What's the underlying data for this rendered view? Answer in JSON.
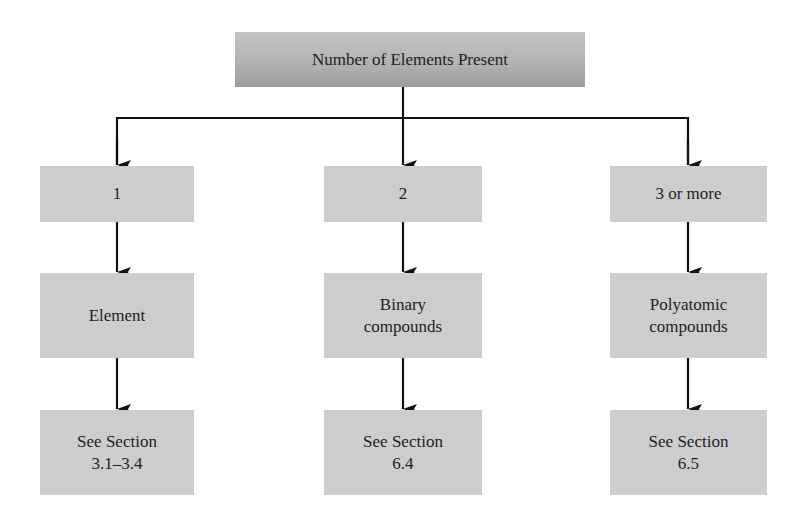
{
  "diagram": {
    "root": {
      "label": "Number of Elements Present"
    },
    "branches": [
      {
        "count_label": "1",
        "category_label": "Element",
        "reference_label": "See Section\n3.1–3.4"
      },
      {
        "count_label": "2",
        "category_label": "Binary\ncompounds",
        "reference_label": "See Section\n6.4"
      },
      {
        "count_label": "3 or more",
        "category_label": "Polyatomic\ncompounds",
        "reference_label": "See Section\n6.5"
      }
    ],
    "colors": {
      "box_fill": "#cdcdcd",
      "root_fill_top": "#c4c4c4",
      "root_fill_bottom": "#9c9c9c",
      "line": "#111111"
    }
  }
}
